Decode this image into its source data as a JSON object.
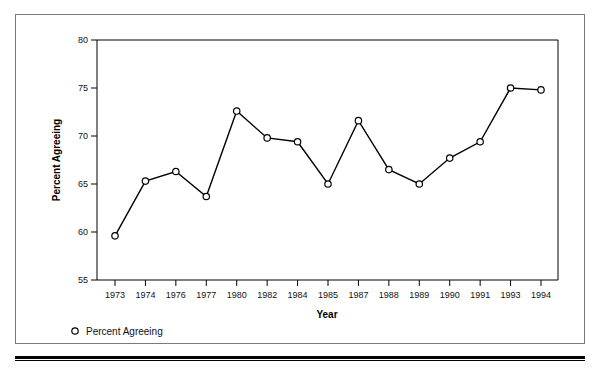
{
  "chart_data": {
    "type": "line",
    "title": "",
    "xlabel": "Year",
    "ylabel": "Percent Agreeing",
    "categories": [
      "1973",
      "1974",
      "1976",
      "1977",
      "1980",
      "1982",
      "1984",
      "1985",
      "1987",
      "1988",
      "1989",
      "1990",
      "1991",
      "1993",
      "1994"
    ],
    "series": [
      {
        "name": "Percent Agreeing",
        "marker": "open-circle",
        "color": "#000000",
        "values": [
          59.6,
          65.3,
          66.3,
          63.7,
          72.6,
          69.8,
          69.4,
          65.0,
          71.6,
          66.5,
          65.0,
          67.7,
          69.4,
          75.0,
          74.8
        ]
      }
    ],
    "ylim": [
      55,
      80
    ],
    "yticks": [
      "55",
      "60",
      "65",
      "70",
      "75",
      "80"
    ],
    "ytick_values": [
      55,
      60,
      65,
      70,
      75,
      80
    ],
    "grid": false,
    "legend": {
      "position": "bottom-left",
      "entries": [
        {
          "label": "Percent Agreeing",
          "marker": "open-circle"
        }
      ]
    }
  },
  "axes": {
    "x_title": "Year",
    "y_title": "Percent Agreeing"
  },
  "legend": {
    "entry_label": "Percent Agreeing"
  },
  "colors": {
    "line": "#000000",
    "marker_fill": "#ffffff",
    "frame": "#7a7a7a",
    "rule": "#000000"
  }
}
